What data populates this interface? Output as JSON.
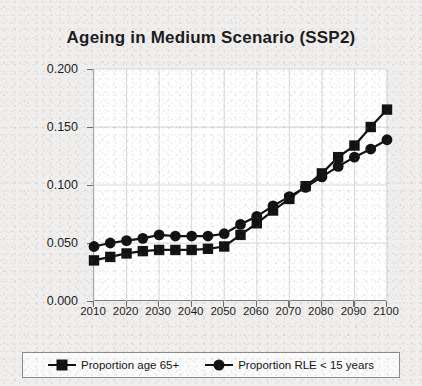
{
  "chart_data": {
    "type": "line",
    "title": "Ageing in Medium Scenario (SSP2)",
    "xlabel": "",
    "ylabel": "Proportion",
    "xlim": [
      2010,
      2100
    ],
    "ylim": [
      0.0,
      0.2
    ],
    "grid": true,
    "legend_position": "bottom",
    "x": [
      2010,
      2015,
      2020,
      2025,
      2030,
      2035,
      2040,
      2045,
      2050,
      2055,
      2060,
      2065,
      2070,
      2075,
      2080,
      2085,
      2090,
      2095,
      2100
    ],
    "xticks": [
      "2010",
      "2020",
      "2030",
      "2040",
      "2050",
      "2060",
      "2070",
      "2080",
      "2090",
      "2100"
    ],
    "yticks": [
      "0.000",
      "0.050",
      "0.100",
      "0.150",
      "0.200"
    ],
    "series": [
      {
        "name": "Proportion age 65+",
        "marker": "square",
        "values": [
          0.035,
          0.038,
          0.041,
          0.043,
          0.044,
          0.044,
          0.044,
          0.045,
          0.047,
          0.057,
          0.067,
          0.078,
          0.088,
          0.099,
          0.11,
          0.124,
          0.134,
          0.15,
          0.165
        ]
      },
      {
        "name": "Proportion RLE < 15 years",
        "marker": "circle",
        "values": [
          0.047,
          0.05,
          0.052,
          0.054,
          0.057,
          0.056,
          0.056,
          0.056,
          0.058,
          0.066,
          0.073,
          0.082,
          0.09,
          0.098,
          0.107,
          0.116,
          0.124,
          0.131,
          0.139
        ]
      }
    ],
    "colors": {
      "series": "#111111",
      "axis": "#6d6d6d",
      "grid": "#d8d8d8",
      "plot_background": "#ffffff",
      "page_background": "#f0efee"
    }
  }
}
